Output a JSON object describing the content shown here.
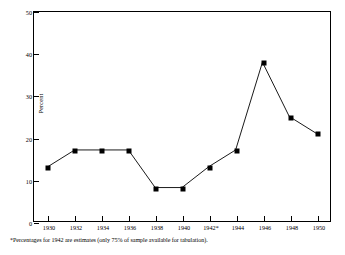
{
  "chart_data": {
    "type": "line",
    "title": "",
    "subtitle": "",
    "xlabel": "",
    "ylabel": "Percent",
    "categories": [
      "1930",
      "1932",
      "1934",
      "1936",
      "1938",
      "1940",
      "1942*",
      "1944",
      "1946",
      "1948",
      "1950"
    ],
    "values": [
      13,
      17,
      17,
      17,
      8,
      8,
      13,
      17,
      38,
      25,
      21
    ],
    "x": [
      1930,
      1932,
      1934,
      1936,
      1938,
      1940,
      1942,
      1944,
      1946,
      1948,
      1950
    ],
    "xlim": [
      1929,
      1951
    ],
    "ylim": [
      0,
      50
    ],
    "ytick_labels": [
      "0",
      "10",
      "20",
      "30",
      "40",
      "50"
    ],
    "ytick_values": [
      0,
      10,
      20,
      30,
      40,
      50
    ],
    "grid": false,
    "legend": null,
    "marker": "square",
    "line_color": "#000000",
    "marker_color": "#000000",
    "background": "#ffffff",
    "annotations": [
      "*Percentages for 1942 are estimates (only 75% of sample available for tabulation)."
    ]
  },
  "footnote": "*Percentages for 1942 are estimates (only 75% of sample available for tabulation)."
}
